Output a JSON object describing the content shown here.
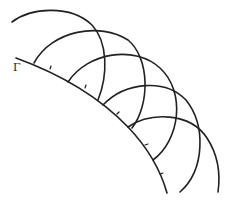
{
  "figure": {
    "boundary_label": "Γ",
    "stroke_color": "#222222",
    "background": "#ffffff",
    "wavefront_count": 5
  }
}
